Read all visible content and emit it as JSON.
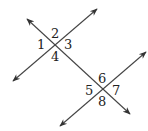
{
  "diagram": {
    "line_color": "#444444",
    "angle_labels": [
      "1",
      "2",
      "3",
      "4",
      "5",
      "6",
      "7",
      "8"
    ]
  }
}
